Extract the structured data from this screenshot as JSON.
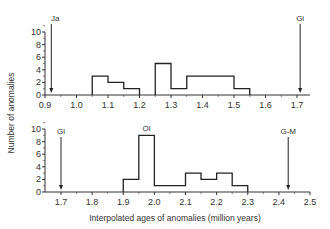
{
  "figure": {
    "ylabel": "Number of anomalies",
    "xlabel": "Interpolated ages of anomalies (million years)"
  },
  "chart_data": [
    {
      "type": "bar",
      "subtype": "histogram",
      "panel": "top",
      "xlabel": "",
      "ylabel": "Number of anomalies",
      "xlim": [
        0.9,
        1.75
      ],
      "ylim": [
        0,
        10
      ],
      "xticks": [
        "0.9",
        "1.0",
        "1.1",
        "1.2",
        "1.3",
        "1.4",
        "1.5",
        "1.6",
        "1.7"
      ],
      "yticks": [
        "0",
        "2",
        "4",
        "6",
        "8",
        "10"
      ],
      "bins": [
        {
          "start": 1.05,
          "end": 1.1,
          "value": 3
        },
        {
          "start": 1.1,
          "end": 1.15,
          "value": 2
        },
        {
          "start": 1.15,
          "end": 1.2,
          "value": 1
        },
        {
          "start": 1.25,
          "end": 1.3,
          "value": 5
        },
        {
          "start": 1.3,
          "end": 1.35,
          "value": 1
        },
        {
          "start": 1.35,
          "end": 1.5,
          "value": 3
        },
        {
          "start": 1.5,
          "end": 1.55,
          "value": 1
        }
      ],
      "annotations": [
        {
          "label": "Ja",
          "x": 0.92
        },
        {
          "label": "Gi",
          "x": 1.71
        }
      ],
      "grid": false
    },
    {
      "type": "bar",
      "subtype": "histogram",
      "panel": "bottom",
      "xlabel": "Interpolated ages of anomalies (million years)",
      "ylabel": "Number of anomalies",
      "xlim": [
        1.65,
        2.5
      ],
      "ylim": [
        0,
        10
      ],
      "xticks": [
        "1.7",
        "1.8",
        "1.9",
        "2.0",
        "2.1",
        "2.2",
        "2.3",
        "2.4",
        "2.5"
      ],
      "yticks": [
        "0",
        "2",
        "4",
        "6",
        "8",
        "10"
      ],
      "bins": [
        {
          "start": 1.9,
          "end": 1.95,
          "value": 2
        },
        {
          "start": 1.95,
          "end": 2.0,
          "value": 9
        },
        {
          "start": 2.0,
          "end": 2.1,
          "value": 1
        },
        {
          "start": 2.1,
          "end": 2.15,
          "value": 3
        },
        {
          "start": 2.15,
          "end": 2.2,
          "value": 2
        },
        {
          "start": 2.2,
          "end": 2.25,
          "value": 3
        },
        {
          "start": 2.25,
          "end": 2.3,
          "value": 1
        }
      ],
      "annotations": [
        {
          "label": "Gi",
          "x": 1.7
        },
        {
          "label": "Ol",
          "x": 1.975
        },
        {
          "label": "G-M",
          "x": 2.43
        }
      ],
      "grid": false
    }
  ]
}
